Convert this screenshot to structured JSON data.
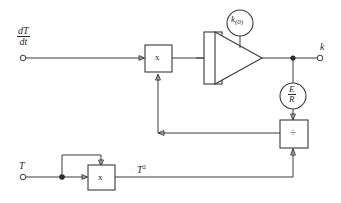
{
  "diagram": {
    "inputs": [
      {
        "id": "ddt",
        "numerator": "dT",
        "denominator": "dt",
        "terminal": "open-circle"
      },
      {
        "id": "temperature",
        "label": "T",
        "terminal": "open-circle"
      }
    ],
    "outputs": [
      {
        "id": "k",
        "label": "k",
        "terminal": "open-circle"
      }
    ],
    "blocks": [
      {
        "id": "multiplier-top",
        "symbol": "x",
        "type": "multiplier"
      },
      {
        "id": "integrator-amplifier",
        "symbol": "",
        "type": "integrator"
      },
      {
        "id": "multiplier-bottom",
        "symbol": "x",
        "type": "multiplier"
      },
      {
        "id": "divider",
        "symbol": "÷",
        "type": "divider"
      }
    ],
    "sources": [
      {
        "id": "initial-condition",
        "base": "k",
        "subscript": "(0)",
        "type": "initial-condition"
      },
      {
        "id": "gain-constant",
        "numerator": "E",
        "denominator": "R",
        "type": "constant-source"
      }
    ],
    "signal_labels": [
      {
        "id": "t-squared",
        "base": "T",
        "exponent": "2"
      }
    ]
  }
}
